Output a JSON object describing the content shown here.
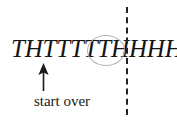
{
  "figure": {
    "background_color": "#ffffff",
    "width": 177,
    "height": 122
  },
  "sequence": {
    "text": "THTTTTTHHHH...",
    "style": "italic-serif",
    "color": "#141414",
    "flips": [
      "T",
      "H",
      "T",
      "T",
      "T",
      "T",
      "T",
      "H",
      "H",
      "H",
      "H"
    ],
    "ellipsis": "..."
  },
  "highlight": {
    "shape": "ellipse",
    "stroke_color": "#b2b2b2",
    "encircles": "TH"
  },
  "divider": {
    "orientation": "vertical",
    "style": "dashed",
    "color": "#222222"
  },
  "annotation": {
    "caption": "start over",
    "arrow_direction": "up",
    "arrow_color": "#1a1a1a",
    "points_at": "H"
  }
}
